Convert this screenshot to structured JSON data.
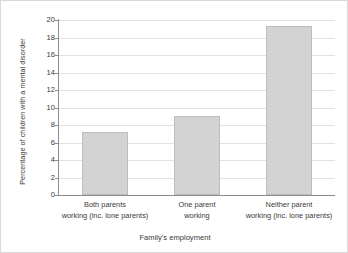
{
  "chart_data": {
    "type": "bar",
    "title": "",
    "xlabel": "Family's employment",
    "ylabel": "Percentage of children with a mental disorder",
    "categories": [
      "Both parents working (inc. lone parents)",
      "One parent working",
      "Neither parent working (inc. lone parents)"
    ],
    "category_lines": [
      [
        "Both parents",
        "working (inc. lone parents)"
      ],
      [
        "One parent",
        "working"
      ],
      [
        "Neither parent",
        "working (inc. lone parents)"
      ]
    ],
    "values": [
      7.2,
      9.0,
      19.3
    ],
    "ylim": [
      0,
      20
    ],
    "yticks": [
      0,
      2,
      4,
      6,
      8,
      10,
      12,
      14,
      16,
      18,
      20
    ],
    "ytick_labels": [
      "0",
      "2",
      "4",
      "6",
      "8",
      "10",
      "12",
      "14",
      "16",
      "18",
      "20"
    ],
    "grid": true,
    "legend": null,
    "colors": {
      "bar_fill": "#d3d3d3",
      "bar_edge": "#bdbdbd",
      "gridline": "#e2e2e2",
      "axis": "#8c8c8c",
      "text": "#3a3a3a",
      "background": "#ffffff",
      "frame": "#d9d9d9"
    }
  }
}
